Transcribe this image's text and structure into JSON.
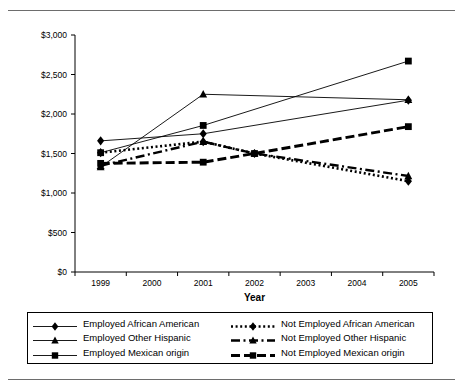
{
  "figure": {
    "rule_top": "horizontal-rule",
    "rule_bottom": "horizontal-rule"
  },
  "chart_data": {
    "type": "line",
    "title": "",
    "subtitle": "",
    "xlabel": "Year",
    "ylabel": "",
    "x": [
      1999,
      2001,
      2002,
      2005
    ],
    "categories": [
      "1999",
      "2000",
      "2001",
      "2002",
      "2003",
      "2004",
      "2005"
    ],
    "xlim": [
      1998.5,
      2005.5
    ],
    "ylim": [
      0,
      3000
    ],
    "ytick_values": [
      0,
      500,
      1000,
      1500,
      2000,
      2500,
      3000
    ],
    "ytick_labels": [
      "$0",
      "$500",
      "$1,000",
      "$1,500",
      "$2,000",
      "$2,500",
      "$3,000"
    ],
    "xtick_labels": [
      "1999",
      "2000",
      "2001",
      "2002",
      "2003",
      "2004",
      "2005"
    ],
    "grid": false,
    "legend_position": "below",
    "series": [
      {
        "name": "Employed African American",
        "marker": "diamond",
        "linestyle": "solid",
        "color": "#000000",
        "x": [
          1999,
          2001,
          2005
        ],
        "values": [
          1660,
          1750,
          2175
        ]
      },
      {
        "name": "Employed Other Hispanic",
        "marker": "triangle",
        "linestyle": "solid",
        "color": "#000000",
        "x": [
          1999,
          2001,
          2005
        ],
        "values": [
          1330,
          2250,
          2180
        ]
      },
      {
        "name": "Employed Mexican origin",
        "marker": "square",
        "linestyle": "solid",
        "color": "#000000",
        "x": [
          1999,
          2001,
          2005
        ],
        "values": [
          1510,
          1855,
          2670
        ]
      },
      {
        "name": "Not Employed African American",
        "marker": "diamond",
        "linestyle": "dotted",
        "color": "#000000",
        "x": [
          1999,
          2001,
          2002,
          2005
        ],
        "values": [
          1510,
          1650,
          1500,
          1150
        ]
      },
      {
        "name": "Not Employed Other Hispanic",
        "marker": "triangle",
        "linestyle": "dashdot",
        "color": "#000000",
        "x": [
          1999,
          2001,
          2002,
          2005
        ],
        "values": [
          1345,
          1650,
          1500,
          1215
        ]
      },
      {
        "name": "Not Employed Mexican origin",
        "marker": "square",
        "linestyle": "dashed",
        "color": "#000000",
        "x": [
          1999,
          2001,
          2002,
          2005
        ],
        "values": [
          1375,
          1390,
          1500,
          1840
        ]
      }
    ]
  },
  "legend": {
    "items": [
      {
        "label": "Employed African American",
        "marker": "diamond",
        "style": "solid"
      },
      {
        "label": "Not Employed African American",
        "marker": "diamond",
        "style": "dotted"
      },
      {
        "label": "Employed Other Hispanic",
        "marker": "triangle",
        "style": "solid"
      },
      {
        "label": "Not Employed Other Hispanic",
        "marker": "triangle",
        "style": "dashdot"
      },
      {
        "label": "Employed Mexican origin",
        "marker": "square",
        "style": "solid"
      },
      {
        "label": "Not Employed Mexican origin",
        "marker": "square",
        "style": "dashed"
      }
    ]
  }
}
